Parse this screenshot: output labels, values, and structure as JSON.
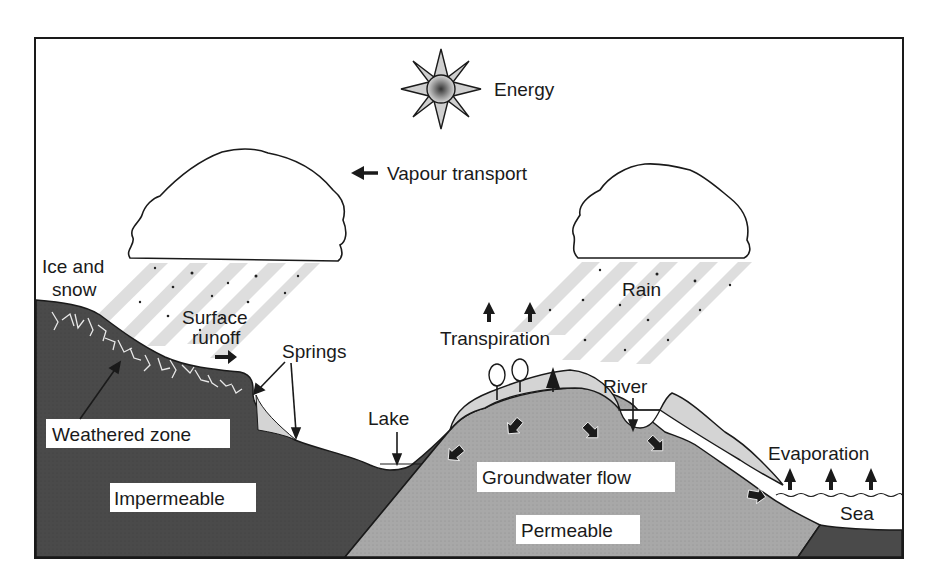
{
  "diagram": {
    "labels": {
      "energy": "Energy",
      "vapour_transport": "Vapour transport",
      "ice_and_snow_line1": "Ice and",
      "ice_and_snow_line2": "snow",
      "surface_runoff_line1": "Surface",
      "surface_runoff_line2": "runoff",
      "springs": "Springs",
      "transpiration": "Transpiration",
      "rain": "Rain",
      "river": "River",
      "lake": "Lake",
      "weathered_zone": "Weathered zone",
      "impermeable": "Impermeable",
      "groundwater_flow": "Groundwater flow",
      "permeable": "Permeable",
      "evaporation": "Evaporation",
      "sea": "Sea"
    },
    "colors": {
      "impermeable_rock": "#4a4a4a",
      "permeable_rock": "#a8a8a8",
      "soil_layer": "#d4d4d4",
      "rain_streak": "#dedede",
      "outline": "#1a1a1a",
      "background": "#ffffff"
    }
  }
}
